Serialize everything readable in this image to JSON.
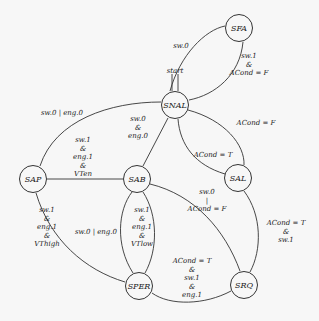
{
  "diagram": {
    "type": "state-machine",
    "nodes": [
      {
        "id": "SFA",
        "label": "SFA",
        "x": 239,
        "y": 28
      },
      {
        "id": "SNAL",
        "label": "SNAL",
        "x": 175,
        "y": 105
      },
      {
        "id": "SAL",
        "label": "SAL",
        "x": 238,
        "y": 178
      },
      {
        "id": "SAP",
        "label": "SAP",
        "x": 33,
        "y": 179
      },
      {
        "id": "SAB",
        "label": "SAB",
        "x": 137,
        "y": 179
      },
      {
        "id": "SPER",
        "label": "SPER",
        "x": 139,
        "y": 286
      },
      {
        "id": "SRQ",
        "label": "SRQ",
        "x": 244,
        "y": 285
      }
    ],
    "start_label": "start",
    "edges": [
      {
        "from": "SNAL",
        "to": "SFA",
        "label": "sw.0"
      },
      {
        "from": "SFA",
        "to": "SNAL",
        "label": "sw.1\n&\nACond = F"
      },
      {
        "from": "SNAL",
        "to": "SAP",
        "label": "sw.0 | eng.0"
      },
      {
        "from": "SNAL",
        "to": "SAB",
        "label": "sw.0\n&\neng.0"
      },
      {
        "from": "SNAL",
        "to": "SAL",
        "label": "ACond = F"
      },
      {
        "from": "SAL",
        "to": "SNAL",
        "label": "ACond = T"
      },
      {
        "from": "SAP",
        "to": "SAB",
        "label": "sw.1\n&\neng.1\n&\nVTen"
      },
      {
        "from": "SAP",
        "to": "SPER",
        "label": "sw.1\n&\neng.1\n&\nVThigh"
      },
      {
        "from": "SPER",
        "to": "SAB",
        "label": "sw.0 | eng.0"
      },
      {
        "from": "SAB",
        "to": "SPER",
        "label": "sw.1\n&\neng.1\n&\nVTlow"
      },
      {
        "from": "SAB",
        "to": "SRQ",
        "label": "sw.0\n|\nACond = F"
      },
      {
        "from": "SAL",
        "to": "SRQ",
        "label": "ACond = T\n&\nsw.1"
      },
      {
        "from": "SRQ",
        "to": "SPER",
        "label": "ACond = T\n&\nsw.1\n&\neng.1"
      }
    ]
  }
}
